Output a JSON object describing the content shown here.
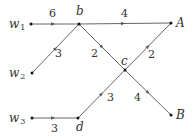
{
  "diagram": {
    "nodes": [
      {
        "id": "w1",
        "label": "w",
        "sub": "1",
        "x": 31,
        "y": 24
      },
      {
        "id": "w2",
        "label": "w",
        "sub": "2",
        "x": 32,
        "y": 73
      },
      {
        "id": "w3",
        "label": "w",
        "sub": "3",
        "x": 32,
        "y": 118
      },
      {
        "id": "b",
        "label": "b",
        "sub": "",
        "x": 79,
        "y": 24
      },
      {
        "id": "c",
        "label": "c",
        "sub": "",
        "x": 125,
        "y": 70
      },
      {
        "id": "d",
        "label": "d",
        "sub": "",
        "x": 78,
        "y": 118
      },
      {
        "id": "A",
        "label": "A",
        "sub": "",
        "x": 171,
        "y": 23
      },
      {
        "id": "B",
        "label": "B",
        "sub": "",
        "x": 171,
        "y": 115
      }
    ],
    "edges": [
      {
        "from": "w1",
        "to": "b",
        "weight": "6"
      },
      {
        "from": "w2",
        "to": "b",
        "weight": "3"
      },
      {
        "from": "w3",
        "to": "d",
        "weight": "3"
      },
      {
        "from": "b",
        "to": "A",
        "weight": "4"
      },
      {
        "from": "b",
        "to": "c",
        "weight": "2"
      },
      {
        "from": "c",
        "to": "A",
        "weight": "2"
      },
      {
        "from": "d",
        "to": "c",
        "weight": "3"
      },
      {
        "from": "c",
        "to": "B",
        "weight": "4"
      }
    ]
  },
  "labels": {
    "w1": "w",
    "w1_sub": "1",
    "w2": "w",
    "w2_sub": "2",
    "w3": "w",
    "w3_sub": "3",
    "b": "b",
    "c": "c",
    "d": "d",
    "A": "A",
    "B": "B",
    "e_w1_b": "6",
    "e_w2_b": "3",
    "e_w3_d": "3",
    "e_b_A": "4",
    "e_b_c": "2",
    "e_c_A": "2",
    "e_d_c": "3",
    "e_c_B": "4"
  }
}
